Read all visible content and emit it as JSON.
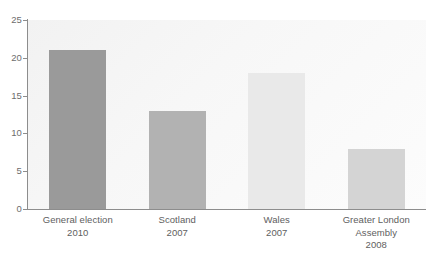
{
  "chart_data": {
    "type": "bar",
    "title": "",
    "subtitle": "",
    "xlabel": "",
    "ylabel": "",
    "ylim": [
      0,
      25
    ],
    "yticks": [
      0,
      5,
      10,
      15,
      20,
      25
    ],
    "grid": false,
    "legend": "none",
    "categories": [
      "General election 2010",
      "Scotland 2007",
      "Wales 2007",
      "Greater London Assembly 2008"
    ],
    "values": [
      21,
      13,
      18,
      8
    ],
    "bar_colors": [
      "#9a9a9a",
      "#b2b2b2",
      "#e9e9e9",
      "#d4d4d4"
    ]
  },
  "axes": {
    "y_tick_labels": [
      "25",
      "20",
      "15",
      "10",
      "5",
      "0"
    ],
    "axis_color": "#8d8d8d",
    "tick_label_color": "#6d6d6d"
  },
  "categories": [
    {
      "name": "General election",
      "year": "2010",
      "lines": [
        "General election",
        "2010"
      ],
      "value": 21,
      "color": "#9a9a9a"
    },
    {
      "name": "Scotland",
      "year": "2007",
      "lines": [
        "Scotland",
        "2007"
      ],
      "value": 13,
      "color": "#b2b2b2"
    },
    {
      "name": "Wales",
      "year": "2007",
      "lines": [
        "Wales",
        "2007"
      ],
      "value": 18,
      "color": "#e9e9e9"
    },
    {
      "name": "Greater London Assembly",
      "year": "2008",
      "lines": [
        "Greater London",
        "Assembly",
        "2008"
      ],
      "value": 8,
      "color": "#d4d4d4"
    }
  ]
}
